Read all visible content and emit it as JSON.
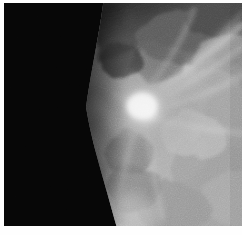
{
  "image": {
    "modality": "mammogram",
    "view_label": "",
    "width": 242,
    "height": 235,
    "border_color": "#ffffff",
    "background_color": "#000000",
    "colorspace": "grayscale"
  },
  "scan": {
    "canvas": {
      "x": 4,
      "y": 3,
      "width": 238,
      "height": 223
    },
    "regions": [
      {
        "name": "air-background",
        "description": "black non-tissue field, left portion",
        "mean_gray": 8
      },
      {
        "name": "skin-line",
        "description": "curved anterior breast boundary",
        "mean_gray": 70
      },
      {
        "name": "fibroglandular-tissue",
        "description": "mottled mid-gray parenchyma filling right side",
        "mean_gray": 150
      },
      {
        "name": "dense-mass",
        "description": "bright spiculated mass",
        "mean_gray": 238
      },
      {
        "name": "fatty-tissue",
        "description": "darker gray region upper right",
        "mean_gray": 62
      }
    ],
    "mass": {
      "center_x": 141,
      "center_y": 106,
      "radius": 30,
      "peak_gray": 245
    },
    "boundary_path": [
      {
        "x": 104,
        "y": 0
      },
      {
        "x": 100,
        "y": 40
      },
      {
        "x": 92,
        "y": 78
      },
      {
        "x": 86,
        "y": 108
      },
      {
        "x": 92,
        "y": 140
      },
      {
        "x": 102,
        "y": 172
      },
      {
        "x": 112,
        "y": 200
      },
      {
        "x": 118,
        "y": 223
      }
    ],
    "spicules": [
      {
        "angle_deg": 205,
        "length": 120
      },
      {
        "angle_deg": 225,
        "length": 105
      },
      {
        "angle_deg": 245,
        "length": 95
      },
      {
        "angle_deg": 25,
        "length": 118
      },
      {
        "angle_deg": 40,
        "length": 100
      },
      {
        "angle_deg": 60,
        "length": 92
      },
      {
        "angle_deg": 120,
        "length": 85
      },
      {
        "angle_deg": 300,
        "length": 80
      },
      {
        "angle_deg": 330,
        "length": 95
      }
    ],
    "stroma_blobs": [
      {
        "cx": 175,
        "cy": 35,
        "r": 34,
        "gray": 92
      },
      {
        "cx": 215,
        "cy": 18,
        "r": 28,
        "gray": 70
      },
      {
        "cx": 230,
        "cy": 62,
        "r": 36,
        "gray": 150
      },
      {
        "cx": 196,
        "cy": 96,
        "r": 40,
        "gray": 168
      },
      {
        "cx": 232,
        "cy": 120,
        "r": 34,
        "gray": 162
      },
      {
        "cx": 160,
        "cy": 150,
        "r": 38,
        "gray": 176
      },
      {
        "cx": 205,
        "cy": 165,
        "r": 36,
        "gray": 158
      },
      {
        "cx": 236,
        "cy": 196,
        "r": 34,
        "gray": 170
      },
      {
        "cx": 170,
        "cy": 205,
        "r": 32,
        "gray": 150
      },
      {
        "cx": 130,
        "cy": 185,
        "r": 26,
        "gray": 128
      },
      {
        "cx": 124,
        "cy": 150,
        "r": 22,
        "gray": 120
      },
      {
        "cx": 152,
        "cy": 60,
        "r": 24,
        "gray": 96
      },
      {
        "cx": 118,
        "cy": 58,
        "r": 18,
        "gray": 58
      },
      {
        "cx": 190,
        "cy": 132,
        "r": 30,
        "gray": 186
      },
      {
        "cx": 148,
        "cy": 122,
        "r": 26,
        "gray": 200
      }
    ]
  }
}
